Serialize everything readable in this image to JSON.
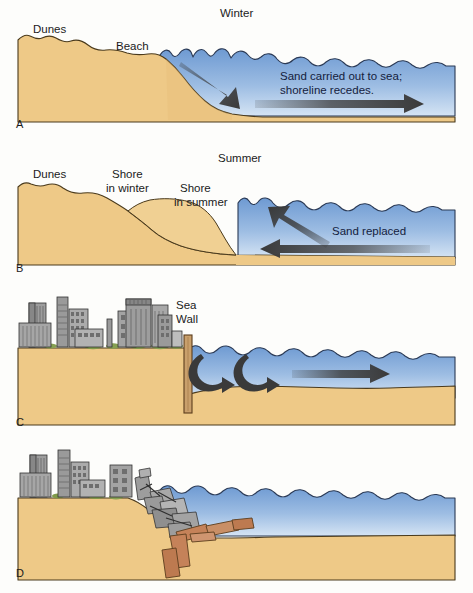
{
  "figure": {
    "background": "#ffffff"
  },
  "colors": {
    "sand": "#eec987",
    "sand_shadow": "#e3b96f",
    "sand_outline": "#4a3a1c",
    "water_top": "#6e9ad2",
    "water_bottom": "#cfe0f2",
    "water_outline": "#2b3a55",
    "arrow_dark": "#3a3a3a",
    "building_gray": "#9d9d9d",
    "building_dark": "#6e6e6e",
    "building_outline": "#333333",
    "seawall": "#c9a06c",
    "seawall_outline": "#5b3d1d",
    "debris_wood": "#c58259",
    "vegetation": "#7f9a4a",
    "text": "#1b1b1b"
  },
  "panels": [
    {
      "letter": "A",
      "season": "Winter",
      "labels": [
        "Dunes",
        "Beach"
      ],
      "callout_lines": [
        "Sand carried out to sea;",
        "shoreline recedes."
      ],
      "arrows": [
        {
          "name": "offshore-transport-arrow",
          "direction": "down-right"
        },
        {
          "name": "seaward-current-arrow",
          "direction": "right"
        }
      ]
    },
    {
      "letter": "B",
      "season": "Summer",
      "labels": [
        "Dunes",
        "Shore\nin winter",
        "Shore\nin summer"
      ],
      "callout_lines": [
        "Sand replaced"
      ],
      "arrows": [
        {
          "name": "onshore-transport-arrow",
          "direction": "up-left"
        },
        {
          "name": "shoreward-current-arrow",
          "direction": "left"
        }
      ]
    },
    {
      "letter": "C",
      "season": "",
      "labels": [
        "Sea\nWall"
      ],
      "callout_lines": [],
      "arrows": [
        {
          "name": "scour-vortex-arrow-1",
          "direction": "curl-right"
        },
        {
          "name": "scour-vortex-arrow-2",
          "direction": "curl-right"
        },
        {
          "name": "longshore-current-arrow",
          "direction": "right"
        }
      ]
    },
    {
      "letter": "D",
      "season": "",
      "labels": [],
      "callout_lines": [],
      "arrows": []
    }
  ],
  "panel_a": {
    "letter": "A",
    "season": "Winter",
    "dunes_label": "Dunes",
    "beach_label": "Beach",
    "callout_line1": "Sand carried out to sea;",
    "callout_line2": "shoreline recedes."
  },
  "panel_b": {
    "letter": "B",
    "season": "Summer",
    "dunes_label": "Dunes",
    "shore_winter_line1": "Shore",
    "shore_winter_line2": "in winter",
    "shore_summer_line1": "Shore",
    "shore_summer_line2": "in summer",
    "callout": "Sand replaced"
  },
  "panel_c": {
    "letter": "C",
    "seawall_line1": "Sea",
    "seawall_line2": "Wall"
  },
  "panel_d": {
    "letter": "D"
  }
}
